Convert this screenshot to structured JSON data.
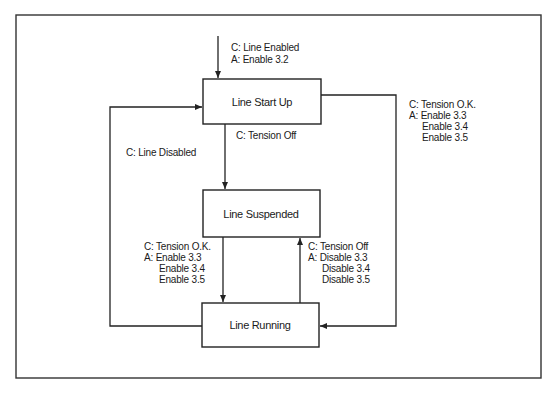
{
  "diagram": {
    "type": "state-transition",
    "states": {
      "start_up": "Line Start Up",
      "suspended": "Line Suspended",
      "running": "Line Running"
    },
    "transitions": {
      "entry": {
        "condition": "C:  Line Enabled",
        "action": "A:  Enable 3.2"
      },
      "startup_to_suspended": {
        "condition": "C:  Tension Off"
      },
      "running_to_startup": {
        "condition": "C:  Line Disabled"
      },
      "startup_to_running": {
        "condition": "C:  Tension O.K.",
        "action": "A:  Enable 3.3",
        "action_2": "Enable 3.4",
        "action_3": "Enable 3.5"
      },
      "suspended_to_running": {
        "condition": "C:  Tension O.K.",
        "action": "A:  Enable 3.3",
        "action_2": "Enable 3.4",
        "action_3": "Enable 3.5"
      },
      "running_to_suspended": {
        "condition": "C:  Tension Off",
        "action": "A:  Disable 3.3",
        "action_2": "Disable 3.4",
        "action_3": "Disable 3.5"
      }
    },
    "colors": {
      "line": "#222222",
      "background": "#ffffff"
    }
  }
}
